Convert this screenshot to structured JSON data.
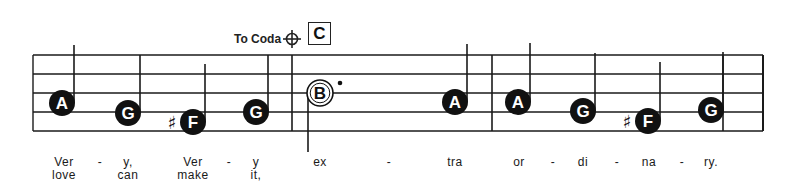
{
  "score": {
    "coda_label": "To Coda",
    "coda_symbol": "coda-icon",
    "rehearsal_mark": "C",
    "staff": {
      "lines_y": [
        55,
        74,
        93,
        112,
        131
      ],
      "left_x": 33,
      "right_x": 763,
      "barlines_x": [
        292,
        492,
        723
      ]
    },
    "notes": [
      {
        "letter": "A",
        "x": 62,
        "y": 103,
        "filled": true,
        "stem": "up",
        "stem_top": 45
      },
      {
        "letter": "G",
        "x": 128,
        "y": 113,
        "filled": true,
        "stem": "up",
        "stem_top": 55
      },
      {
        "letter": "F",
        "x": 193,
        "y": 122,
        "filled": true,
        "stem": "up",
        "stem_top": 64,
        "accidental": "♯"
      },
      {
        "letter": "G",
        "x": 256,
        "y": 112,
        "filled": true,
        "stem": "up",
        "stem_top": 55
      },
      {
        "letter": "B",
        "x": 320,
        "y": 93,
        "filled": false,
        "stem": "down",
        "stem_bottom": 152,
        "dotted": true
      },
      {
        "letter": "A",
        "x": 455,
        "y": 102,
        "filled": true,
        "stem": "up",
        "stem_top": 44
      },
      {
        "letter": "A",
        "x": 518,
        "y": 102,
        "filled": true,
        "stem": "up",
        "stem_top": 43
      },
      {
        "letter": "G",
        "x": 583,
        "y": 111,
        "filled": true,
        "stem": "up",
        "stem_top": 53
      },
      {
        "letter": "F",
        "x": 648,
        "y": 121,
        "filled": true,
        "stem": "up",
        "stem_top": 62,
        "accidental": "♯"
      },
      {
        "letter": "G",
        "x": 711,
        "y": 110,
        "filled": true,
        "stem": "up",
        "stem_top": 52
      }
    ],
    "lyrics": {
      "verse1": [
        {
          "text": "Ver",
          "x": 64
        },
        {
          "text": "-",
          "x": 100
        },
        {
          "text": "y,",
          "x": 128
        },
        {
          "text": "Ver",
          "x": 193
        },
        {
          "text": "-",
          "x": 229
        },
        {
          "text": "y",
          "x": 256
        },
        {
          "text": "ex",
          "x": 320
        },
        {
          "text": "-",
          "x": 389
        },
        {
          "text": "tra",
          "x": 455
        },
        {
          "text": "or",
          "x": 519
        },
        {
          "text": "-",
          "x": 553
        },
        {
          "text": "di",
          "x": 583
        },
        {
          "text": "-",
          "x": 617
        },
        {
          "text": "na",
          "x": 649
        },
        {
          "text": "-",
          "x": 682
        },
        {
          "text": "ry.",
          "x": 711
        }
      ],
      "verse2": [
        {
          "text": "love",
          "x": 64
        },
        {
          "text": "can",
          "x": 128
        },
        {
          "text": "make",
          "x": 193
        },
        {
          "text": "it,",
          "x": 256
        }
      ]
    }
  }
}
